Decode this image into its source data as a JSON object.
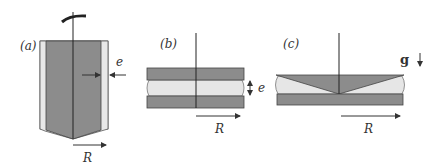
{
  "figure": {
    "panels": [
      {
        "id": "a",
        "label": "(a)",
        "description": "Cone-in-cylinder (Couette-like) geometry with gap"
      },
      {
        "id": "b",
        "label": "(b)",
        "description": "Parallel plates with liquid layer"
      },
      {
        "id": "c",
        "label": "(c)",
        "description": "Cone-and-plate geometry with liquid"
      }
    ],
    "symbols": {
      "gap": "e",
      "radius": "R",
      "gravity": "g"
    },
    "colors": {
      "solid": "#8c8c8c",
      "liquid": "#e6e6e6",
      "outline": "#333333",
      "background": "#ffffff"
    }
  }
}
